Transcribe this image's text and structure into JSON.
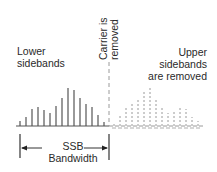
{
  "labels": {
    "lower": [
      "Lower",
      "sidebands"
    ],
    "upper": [
      "Upper",
      "sidebands",
      "are removed"
    ],
    "carrier": [
      "Carrier is",
      "removed"
    ],
    "bandwidth": [
      "SSB",
      "Bandwidth"
    ]
  },
  "colors": {
    "solid_line": "#555555",
    "removed_line": "#9a9a9a",
    "text": "#2a2a2a"
  },
  "spectrum": {
    "baseline_y": 126,
    "carrier_x": 109,
    "lower_sideband_x": [
      20,
      26,
      32,
      38,
      44,
      50,
      56,
      62,
      68,
      74,
      80,
      86,
      92,
      98,
      104
    ],
    "lower_sideband_heights": [
      5,
      9,
      17,
      19,
      16,
      13,
      20,
      28,
      38,
      36,
      28,
      22,
      19,
      11,
      4
    ],
    "upper_sideband_x": [
      114,
      120,
      126,
      132,
      138,
      144,
      150,
      156,
      162,
      168,
      174,
      180,
      186,
      192,
      198
    ],
    "upper_sideband_heights": [
      4,
      11,
      19,
      22,
      28,
      36,
      38,
      28,
      20,
      13,
      16,
      19,
      17,
      9,
      5
    ]
  },
  "bandwidth_marker": {
    "left_x": 20,
    "right_x": 109,
    "arrow_y": 148
  }
}
